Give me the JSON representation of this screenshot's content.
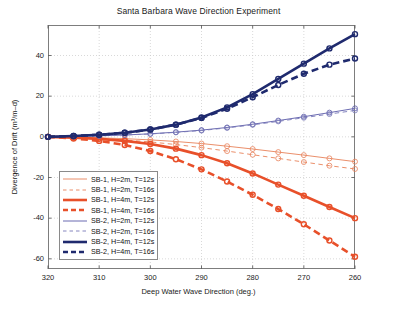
{
  "chart_data": {
    "type": "line",
    "title": "Santa Barbara Wave Direction Experiment",
    "xlabel": "Deep Water Wave Direction (deg.)",
    "ylabel": "Divergence of Drift (m3/m–d)",
    "ylabel_display": "Divergence of Drift (m³/m–d)",
    "xlim": [
      320,
      260
    ],
    "ylim": [
      -65,
      55
    ],
    "xticks": [
      320,
      310,
      300,
      290,
      280,
      270,
      260
    ],
    "yticks": [
      40,
      20,
      0,
      -20,
      -40,
      -60
    ],
    "xtick_labels": [
      "320",
      "310",
      "300",
      "290",
      "280",
      "270",
      "260"
    ],
    "ytick_labels": [
      "40",
      "20",
      "0",
      "-20",
      "-40",
      "-60"
    ],
    "grid": true,
    "grid_style": "dotted",
    "legend_position": "lower left",
    "marker": "circle",
    "x": [
      320,
      315,
      310,
      305,
      300,
      295,
      290,
      285,
      280,
      275,
      270,
      265,
      260
    ],
    "series": [
      {
        "name": "SB-1, H=2m, T=12s",
        "color": "#E8825A",
        "width": 0.9,
        "dash": "solid",
        "values": [
          0,
          -0.2,
          -0.5,
          -0.9,
          -1.5,
          -2.3,
          -3.3,
          -4.6,
          -6.0,
          -7.5,
          -9.0,
          -10.6,
          -12.2
        ]
      },
      {
        "name": "SB-1, H=2m, T=16s",
        "color": "#E8825A",
        "width": 0.9,
        "dash": "dashed",
        "values": [
          0,
          -0.3,
          -0.8,
          -1.5,
          -2.5,
          -3.8,
          -5.3,
          -7.0,
          -8.8,
          -10.6,
          -12.4,
          -14.2,
          -15.8
        ]
      },
      {
        "name": "SB-1, H=4m, T=12s",
        "color": "#E8502A",
        "width": 2.6,
        "dash": "solid",
        "values": [
          0,
          -0.4,
          -1.0,
          -2.0,
          -3.5,
          -5.8,
          -9.0,
          -13.0,
          -18.0,
          -23.5,
          -29.0,
          -34.5,
          -40.0
        ]
      },
      {
        "name": "SB-1, H=4m, T=16s",
        "color": "#E8502A",
        "width": 2.6,
        "dash": "dashed",
        "values": [
          0,
          -0.8,
          -2.0,
          -4.0,
          -7.0,
          -11.0,
          -16.0,
          -22.0,
          -28.5,
          -35.5,
          -43.0,
          -51.0,
          -59.0
        ]
      },
      {
        "name": "SB-2, H=2m, T=12s",
        "color": "#5A5AA8",
        "width": 0.9,
        "dash": "solid",
        "values": [
          0,
          0.2,
          0.5,
          0.9,
          1.5,
          2.3,
          3.3,
          4.6,
          6.2,
          8.0,
          9.9,
          11.9,
          14.0
        ]
      },
      {
        "name": "SB-2, H=2m, T=16s",
        "color": "#7878B8",
        "width": 0.9,
        "dash": "dashed",
        "values": [
          0,
          0.2,
          0.5,
          0.9,
          1.4,
          2.2,
          3.1,
          4.4,
          5.9,
          7.6,
          9.4,
          11.2,
          13.0
        ]
      },
      {
        "name": "SB-2, H=4m, T=12s",
        "color": "#1F2A6E",
        "width": 2.6,
        "dash": "solid",
        "values": [
          0,
          0.4,
          1.0,
          2.0,
          3.6,
          6.0,
          9.5,
          14.5,
          21.0,
          28.5,
          36.0,
          43.5,
          50.5
        ]
      },
      {
        "name": "SB-2, H=4m, T=16s",
        "color": "#1F2A6E",
        "width": 2.6,
        "dash": "dashed",
        "values": [
          0,
          0.4,
          1.0,
          2.0,
          3.6,
          6.0,
          9.3,
          13.8,
          19.5,
          25.5,
          31.0,
          35.5,
          38.5
        ]
      }
    ]
  },
  "axes": {
    "title": "Santa Barbara Wave Direction Experiment",
    "xlabel": "Deep Water Wave Direction (deg.)",
    "ylabel": "Divergence of Drift (m³/m–d)"
  }
}
